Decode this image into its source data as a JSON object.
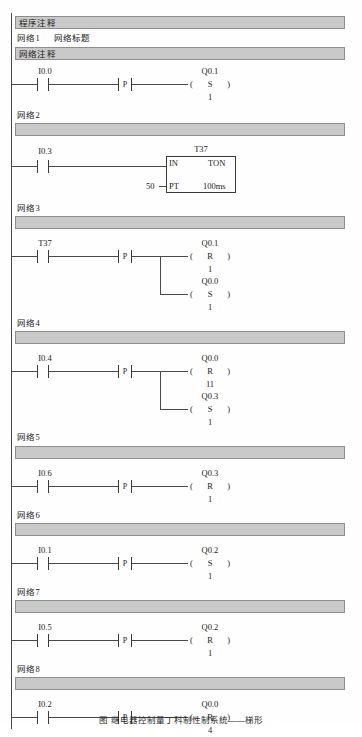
{
  "document": {
    "program_comment": "程序注释",
    "network_comment": "网络注释",
    "caption": "图      继电器控制量丁科制性制系统——梯形"
  },
  "symbols": {
    "positive_transition": "P",
    "set_coil": "S",
    "reset_coil": "R",
    "timer_in": "IN",
    "timer_type": "TON",
    "timer_pt": "PT",
    "timer_timebase": "100ms",
    "timer_preset": "50",
    "timer_name": "T37"
  },
  "networks": [
    {
      "label": "网络1",
      "title": "网络标题",
      "contact": "I0.0",
      "transition": "P",
      "coils": [
        {
          "operand": "Q0.1",
          "type": "S",
          "n": "1"
        }
      ]
    },
    {
      "label": "网络2",
      "title": "",
      "contact": "I0.3",
      "transition": "",
      "block": {
        "name": "T37",
        "in": "IN",
        "type": "TON",
        "pt_label": "PT",
        "pt_value": "50",
        "timebase": "100ms"
      },
      "coils": []
    },
    {
      "label": "网络3",
      "title": "",
      "contact": "T37",
      "transition": "P",
      "coils": [
        {
          "operand": "Q0.1",
          "type": "R",
          "n": "1"
        },
        {
          "operand": "Q0.0",
          "type": "S",
          "n": "1"
        }
      ]
    },
    {
      "label": "网络4",
      "title": "",
      "contact": "I0.4",
      "transition": "P",
      "coils": [
        {
          "operand": "Q0.0",
          "type": "R",
          "n": "11"
        },
        {
          "operand": "Q0.3",
          "type": "S",
          "n": "1"
        }
      ]
    },
    {
      "label": "网络5",
      "title": "",
      "contact": "I0.6",
      "transition": "P",
      "coils": [
        {
          "operand": "Q0.3",
          "type": "R",
          "n": "1"
        }
      ]
    },
    {
      "label": "网络6",
      "title": "",
      "contact": "I0.1",
      "transition": "P",
      "coils": [
        {
          "operand": "Q0.2",
          "type": "S",
          "n": "1"
        }
      ]
    },
    {
      "label": "网络7",
      "title": "",
      "contact": "I0.5",
      "transition": "P",
      "coils": [
        {
          "operand": "Q0.2",
          "type": "R",
          "n": "1"
        }
      ]
    },
    {
      "label": "网络8",
      "title": "",
      "contact": "I0.2",
      "transition": "P",
      "coils": [
        {
          "operand": "Q0.0",
          "type": "R",
          "n": "4"
        }
      ]
    }
  ],
  "colors": {
    "banner_fill": "#c9c9c9",
    "banner_border": "#8e8e8e",
    "wire": "#4a4a4a",
    "text": "#1c1c1c"
  }
}
